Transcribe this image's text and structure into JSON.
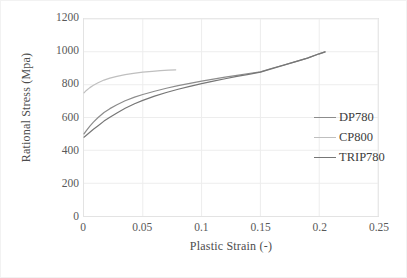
{
  "chart_data": {
    "type": "line",
    "title": "",
    "xlabel": "Plastic Strain (-)",
    "ylabel": "Rational Stress (Mpa)",
    "xlim": [
      0,
      0.25
    ],
    "ylim": [
      0,
      1200
    ],
    "xticks": [
      "0",
      "0.05",
      "0.1",
      "0.15",
      "0.2",
      "0.25"
    ],
    "xtick_values": [
      0,
      0.05,
      0.1,
      0.15,
      0.2,
      0.25
    ],
    "yticks": [
      "0",
      "200",
      "400",
      "600",
      "800",
      "1000",
      "1200"
    ],
    "ytick_values": [
      0,
      200,
      400,
      600,
      800,
      1000,
      1200
    ],
    "grid": "both",
    "legend_position": "right",
    "series": [
      {
        "name": "DP780",
        "color": "#8c8c8c",
        "x": [
          0,
          0.002,
          0.005,
          0.008,
          0.012,
          0.017,
          0.022,
          0.028,
          0.035,
          0.043,
          0.05,
          0.06,
          0.07,
          0.08,
          0.09,
          0.1,
          0.11,
          0.12,
          0.13,
          0.14,
          0.15,
          0.16,
          0.17,
          0.18,
          0.19,
          0.2,
          0.205
        ],
        "y": [
          500,
          520,
          548,
          572,
          600,
          630,
          654,
          678,
          702,
          724,
          740,
          760,
          778,
          794,
          808,
          822,
          834,
          846,
          857,
          868,
          878,
          900,
          920,
          940,
          962,
          988,
          1000
        ]
      },
      {
        "name": "CP800",
        "color": "#bfbfbf",
        "x": [
          0,
          0.002,
          0.005,
          0.008,
          0.012,
          0.017,
          0.022,
          0.028,
          0.035,
          0.042,
          0.05,
          0.058,
          0.065,
          0.072,
          0.078
        ],
        "y": [
          750,
          765,
          782,
          796,
          812,
          828,
          840,
          851,
          861,
          869,
          876,
          881,
          885,
          888,
          890
        ]
      },
      {
        "name": "TRIP780",
        "color": "#767676",
        "x": [
          0,
          0.002,
          0.005,
          0.008,
          0.012,
          0.017,
          0.022,
          0.028,
          0.035,
          0.043,
          0.05,
          0.06,
          0.07,
          0.08,
          0.09,
          0.1,
          0.11,
          0.12,
          0.13,
          0.14,
          0.15,
          0.16,
          0.17,
          0.18,
          0.19,
          0.2,
          0.205
        ],
        "y": [
          480,
          492,
          510,
          528,
          550,
          578,
          602,
          628,
          656,
          684,
          704,
          730,
          752,
          772,
          790,
          806,
          822,
          836,
          850,
          863,
          876,
          898,
          919,
          940,
          962,
          988,
          1000
        ]
      }
    ]
  },
  "legend": {
    "items": [
      {
        "label": "DP780"
      },
      {
        "label": "CP800"
      },
      {
        "label": "TRIP780"
      }
    ]
  }
}
